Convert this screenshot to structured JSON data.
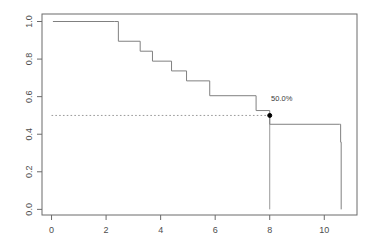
{
  "chart_data": {
    "type": "line",
    "subtype": "kaplan-meier-step",
    "title": "",
    "subtitle": "",
    "xlabel": "",
    "ylabel": "",
    "xlim": [
      -0.35,
      11.2
    ],
    "ylim": [
      -0.03,
      1.04
    ],
    "xticks": [
      0,
      2,
      4,
      6,
      8,
      10
    ],
    "xtick_labels": [
      "0",
      "2",
      "4",
      "6",
      "8",
      "10"
    ],
    "yticks": [
      0.0,
      0.2,
      0.4,
      0.6,
      0.8,
      1.0
    ],
    "ytick_labels": [
      "0.0",
      "0.2",
      "0.4",
      "0.6",
      "0.8",
      "1.0"
    ],
    "grid": false,
    "legend": null,
    "legend_position": "none",
    "box": true,
    "series": [
      {
        "name": "survival",
        "step_type": "hv",
        "color": "#808080",
        "line_width": 1,
        "x": [
          0.05,
          2.3,
          2.45,
          3.25,
          3.7,
          4.4,
          4.95,
          5.8,
          7.5,
          8.0,
          10.55,
          10.6
        ],
        "y": [
          1.0,
          1.0,
          0.895,
          0.842,
          0.789,
          0.737,
          0.684,
          0.605,
          0.526,
          0.453,
          0.453,
          0.358
        ],
        "final_x": 10.62,
        "final_y": 0.0
      }
    ],
    "annotations": [
      {
        "name": "median-label",
        "text": "50.0%",
        "x": 8.05,
        "y": 0.575,
        "color": "#3a3a3a"
      }
    ],
    "markers": [
      {
        "name": "median-point",
        "x": 8.0,
        "y": 0.5,
        "shape": "circle",
        "color": "#000000",
        "size": 4
      }
    ],
    "reference_lines": [
      {
        "name": "median-horizontal",
        "orientation": "horizontal",
        "value": 0.5,
        "from": 0.0,
        "to": 8.0,
        "style": "dotted",
        "color": "#999999"
      },
      {
        "name": "median-vertical",
        "orientation": "vertical",
        "value": 8.0,
        "from": 0.0,
        "to": 0.5,
        "style": "solid",
        "color": "#999999"
      }
    ],
    "axis_color": "#6b6b6b",
    "background": "#ffffff"
  }
}
